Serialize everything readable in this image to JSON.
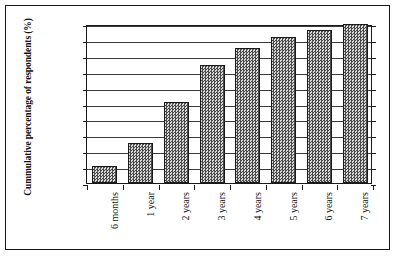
{
  "chart_data": {
    "type": "bar",
    "title": "",
    "xlabel": "",
    "ylabel": "Cummulative percentage of respondents (%)",
    "categories": [
      "6 months",
      "1 year",
      "2 years",
      "3 years",
      "4 years",
      "5 years",
      "6 years",
      "7 years"
    ],
    "values": [
      11,
      25,
      51,
      74,
      85,
      92,
      96,
      100
    ],
    "ylim": [
      0,
      100
    ],
    "yticks": [
      0,
      10,
      20,
      30,
      40,
      50,
      60,
      70,
      80,
      90,
      100
    ],
    "ytick_labels": [
      "0",
      "10",
      "20",
      "30",
      "40",
      "50",
      "60",
      "70",
      "80",
      "90",
      "100"
    ],
    "grid": true,
    "grid_axis": "y",
    "legend": false,
    "legend_position": "none",
    "bar_fill": "#808080",
    "bar_pattern": "checkered-dither",
    "bar_edge_color": "#1a1a1a",
    "axis_color": "#1a1a1a",
    "background": "#ffffff",
    "frame": true,
    "xtick_label_rotation": 90
  }
}
